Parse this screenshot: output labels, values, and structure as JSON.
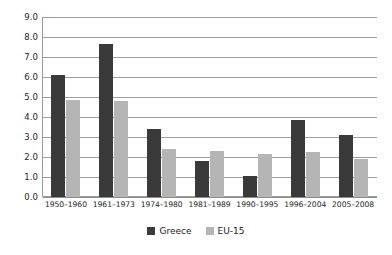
{
  "chart_data": {
    "type": "bar",
    "title": "",
    "subtitle": "",
    "xlabel": "",
    "ylabel": "",
    "ylim": [
      0.0,
      9.0
    ],
    "ytick_step": 1.0,
    "ytick_labels": [
      "9.0",
      "8.0",
      "7.0",
      "6.0",
      "5.0",
      "4.0",
      "3.0",
      "2.0",
      "1.0",
      "0.0"
    ],
    "grid": true,
    "legend_position": "bottom-center",
    "categories": [
      "1950–1960",
      "1961–1973",
      "1974–1980",
      "1981–1989",
      "1990–1995",
      "1996–2004",
      "2005–2008"
    ],
    "series": [
      {
        "name": "Greece",
        "color": "#3a3a3a",
        "values": [
          6.1,
          7.65,
          3.4,
          1.8,
          1.05,
          3.85,
          3.1
        ]
      },
      {
        "name": "EU-15",
        "color": "#b5b5b5",
        "values": [
          4.85,
          4.8,
          2.4,
          2.3,
          2.15,
          2.25,
          1.9
        ]
      }
    ]
  },
  "colors": {
    "background": "#ffffff",
    "gridline": "#9d9d9d",
    "axis": "#9a9a9a",
    "text": "#1a1a1a"
  }
}
